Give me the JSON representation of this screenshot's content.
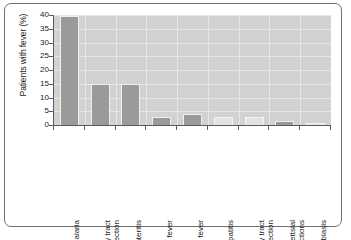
{
  "chart_data": {
    "type": "bar",
    "title": "",
    "subtitle": "",
    "xlabel": "",
    "ylabel": "Patients with fever (%)",
    "ylim": [
      0,
      40
    ],
    "yticks": [
      0,
      5,
      10,
      15,
      20,
      25,
      30,
      35,
      40
    ],
    "ytick_labels": [
      "0",
      "5",
      "10",
      "15",
      "20",
      "25",
      "30",
      "35",
      "40"
    ],
    "grid": true,
    "legend": "none",
    "categories": [
      "Malaria",
      "Respiratory tract\ninfection",
      "Gastroenteritis",
      "Enteric fever",
      "Dengue fever",
      "Viral hepatitis",
      "Urinary tract infection",
      "Rickettsial infections",
      "Amoebiasis"
    ],
    "values": [
      39.5,
      15,
      15,
      3,
      4,
      3,
      3,
      1.5,
      0.7
    ],
    "bar_shades": [
      "dark",
      "dark",
      "dark",
      "dark",
      "dark",
      "light",
      "light",
      "dark",
      "light"
    ],
    "colors": {
      "bar_dark": "#9a9a9a",
      "bar_light": "#e2e2e2",
      "plot_background": "#d2d2d2",
      "gridline": "#e6e6e6",
      "axis": "#5a5a5a",
      "frame": "#6f6f6f",
      "text": "#1a1a1a",
      "page_background": "#ffffff"
    }
  }
}
